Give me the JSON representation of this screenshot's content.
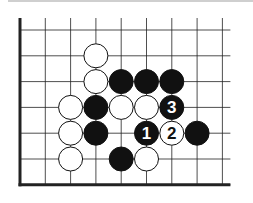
{
  "diagram": {
    "type": "go-board-fragment",
    "colors": {
      "black": "#111111",
      "white": "#ffffff",
      "line": "#222222",
      "edge": "#222222"
    },
    "grid": {
      "cols": 9,
      "rows": 7,
      "origin_x": 20,
      "origin_y": 30,
      "spacing_x": 25.3,
      "spacing_y": 25.8,
      "edges": [
        "left",
        "bottom"
      ]
    },
    "stones": [
      {
        "color": "white",
        "col": 3,
        "row": 1,
        "label": ""
      },
      {
        "color": "white",
        "col": 3,
        "row": 2,
        "label": ""
      },
      {
        "color": "black",
        "col": 4,
        "row": 2,
        "label": ""
      },
      {
        "color": "black",
        "col": 5,
        "row": 2,
        "label": ""
      },
      {
        "color": "black",
        "col": 6,
        "row": 2,
        "label": ""
      },
      {
        "color": "white",
        "col": 2,
        "row": 3,
        "label": ""
      },
      {
        "color": "black",
        "col": 3,
        "row": 3,
        "label": ""
      },
      {
        "color": "white",
        "col": 4,
        "row": 3,
        "label": ""
      },
      {
        "color": "white",
        "col": 5,
        "row": 3,
        "label": ""
      },
      {
        "color": "black",
        "col": 6,
        "row": 3,
        "label": "3"
      },
      {
        "color": "white",
        "col": 2,
        "row": 4,
        "label": ""
      },
      {
        "color": "black",
        "col": 3,
        "row": 4,
        "label": ""
      },
      {
        "color": "black",
        "col": 5,
        "row": 4,
        "label": "1"
      },
      {
        "color": "white",
        "col": 6,
        "row": 4,
        "label": "2"
      },
      {
        "color": "black",
        "col": 7,
        "row": 4,
        "label": ""
      },
      {
        "color": "white",
        "col": 2,
        "row": 5,
        "label": ""
      },
      {
        "color": "black",
        "col": 4,
        "row": 5,
        "label": ""
      },
      {
        "color": "white",
        "col": 5,
        "row": 5,
        "label": ""
      }
    ]
  }
}
